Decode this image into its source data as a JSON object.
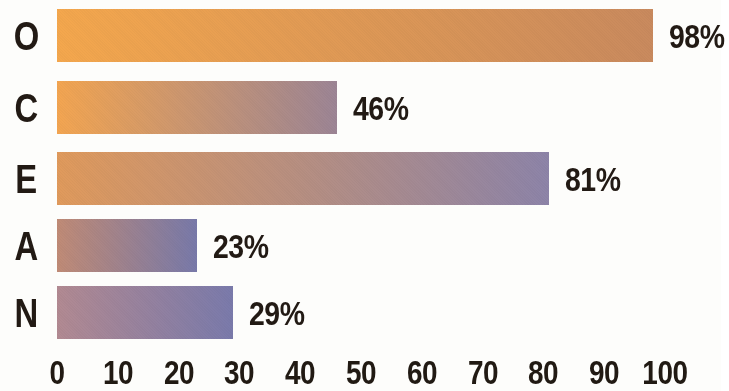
{
  "chart_data": {
    "type": "bar",
    "orientation": "horizontal",
    "title": "",
    "subtitle": "",
    "xlabel": "",
    "ylabel": "",
    "xlim": [
      0,
      100
    ],
    "grid": false,
    "legend": false,
    "categories": [
      "O",
      "C",
      "E",
      "A",
      "N"
    ],
    "values": [
      98,
      46,
      81,
      23,
      29
    ],
    "value_labels": [
      "98%",
      "46%",
      "81%",
      "23%",
      "29%"
    ],
    "xticks": [
      0,
      10,
      20,
      30,
      40,
      50,
      60,
      70,
      80,
      90,
      100
    ],
    "xtick_labels": [
      "0",
      "10",
      "20",
      "30",
      "40",
      "50",
      "60",
      "70",
      "80",
      "90",
      "100"
    ],
    "bars": [
      {
        "category": "O",
        "value": 98,
        "label": "98%",
        "color_start": "#f4a74d",
        "color_end": "#c98a5e"
      },
      {
        "category": "C",
        "value": 46,
        "label": "46%",
        "color_start": "#f3a551",
        "color_end": "#9c8595"
      },
      {
        "category": "E",
        "value": 81,
        "label": "81%",
        "color_start": "#e09a5c",
        "color_end": "#8d84a8"
      },
      {
        "category": "A",
        "value": 23,
        "label": "23%",
        "color_start": "#c08b76",
        "color_end": "#7879a9"
      },
      {
        "category": "N",
        "value": 29,
        "label": "29%",
        "color_start": "#b28a92",
        "color_end": "#7a7aab"
      }
    ],
    "axis_text_color": "#211a13",
    "label_text_color": "#221a14",
    "background_color": "#fdfdfb"
  }
}
